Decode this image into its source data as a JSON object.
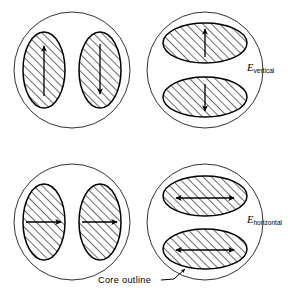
{
  "figure": {
    "background_color": "#ffffff",
    "ink_color": "#000000",
    "hatch_angle_degrees": 45,
    "panels": [
      {
        "id": "top-left",
        "position": "top-left",
        "core_center": [
          72,
          70
        ],
        "core_radius": 58,
        "domain_shape": "tall-ellipse",
        "domain_count": 2,
        "domains": [
          {
            "id": "top-left-domain-1",
            "cx": 44,
            "cy": 70,
            "rx": 21,
            "ry": 38,
            "arrow": "up"
          },
          {
            "id": "top-left-domain-2",
            "cx": 100,
            "cy": 70,
            "rx": 21,
            "ry": 38,
            "arrow": "down"
          }
        ],
        "field_label": null
      },
      {
        "id": "top-right",
        "position": "top-right",
        "core_center": [
          205,
          70
        ],
        "core_radius": 58,
        "domain_shape": "wide-ellipse",
        "domain_count": 2,
        "domains": [
          {
            "id": "top-right-domain-1",
            "cx": 205,
            "cy": 43,
            "rx": 42,
            "ry": 20,
            "arrow": "up"
          },
          {
            "id": "top-right-domain-2",
            "cx": 205,
            "cy": 97,
            "rx": 42,
            "ry": 20,
            "arrow": "down"
          }
        ],
        "field_label": {
          "symbol": "E",
          "subscript": "vertical",
          "x": 247,
          "y": 67
        }
      },
      {
        "id": "bottom-left",
        "position": "bottom-left",
        "core_center": [
          72,
          222
        ],
        "core_radius": 58,
        "domain_shape": "tall-ellipse",
        "domain_count": 2,
        "domains": [
          {
            "id": "bottom-left-domain-1",
            "cx": 44,
            "cy": 222,
            "rx": 21,
            "ry": 38,
            "arrow": "right"
          },
          {
            "id": "bottom-left-domain-2",
            "cx": 100,
            "cy": 222,
            "rx": 21,
            "ry": 38,
            "arrow": "right"
          }
        ],
        "field_label": null
      },
      {
        "id": "bottom-right",
        "position": "bottom-right",
        "core_center": [
          205,
          222
        ],
        "core_radius": 58,
        "domain_shape": "wide-ellipse",
        "domain_count": 2,
        "domains": [
          {
            "id": "bottom-right-domain-1",
            "cx": 205,
            "cy": 196,
            "rx": 42,
            "ry": 20,
            "arrow": "double-horizontal"
          },
          {
            "id": "bottom-right-domain-2",
            "cx": 205,
            "cy": 249,
            "rx": 42,
            "ry": 20,
            "arrow": "double-horizontal"
          }
        ],
        "field_label": {
          "symbol": "E",
          "subscript": "horizontal",
          "x": 247,
          "y": 219
        }
      }
    ],
    "annotation": {
      "text": "Core outline",
      "x": 98,
      "y": 283,
      "leader_from": [
        161,
        280
      ],
      "leader_to": [
        184,
        268
      ]
    }
  }
}
